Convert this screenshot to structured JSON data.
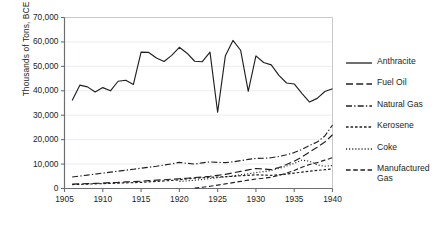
{
  "chart_data": {
    "type": "line",
    "title": "",
    "xlabel": "",
    "ylabel": "Thousands of Tons, BCE",
    "xlim": [
      1905,
      1940
    ],
    "ylim": [
      0,
      70000
    ],
    "grid": true,
    "legend_position": "right",
    "xticks": [
      "1905",
      "1910",
      "1915",
      "1920",
      "1925",
      "1930",
      "1935",
      "1940"
    ],
    "xtick_values": [
      1905,
      1910,
      1915,
      1920,
      1925,
      1930,
      1935,
      1940
    ],
    "yticks": [
      "0",
      "10,000",
      "20,000",
      "30,000",
      "40,000",
      "50,000",
      "60,000",
      "70,000"
    ],
    "ytick_values": [
      0,
      10000,
      20000,
      30000,
      40000,
      50000,
      60000,
      70000
    ],
    "x": [
      1906,
      1907,
      1908,
      1909,
      1910,
      1911,
      1912,
      1913,
      1914,
      1915,
      1916,
      1917,
      1918,
      1919,
      1920,
      1921,
      1922,
      1923,
      1924,
      1925,
      1926,
      1927,
      1928,
      1929,
      1930,
      1931,
      1932,
      1933,
      1934,
      1935,
      1936,
      1937,
      1938,
      1939,
      1940
    ],
    "series": [
      {
        "name": "Anthracite",
        "style": "solid",
        "color": "#231f20",
        "values": [
          36000,
          42300,
          41600,
          39500,
          41300,
          40000,
          43900,
          44300,
          42600,
          55800,
          55700,
          53400,
          52000,
          54500,
          57800,
          55400,
          52100,
          51900,
          55800,
          31200,
          54200,
          60600,
          56600,
          39800,
          54300,
          51600,
          50600,
          46300,
          43200,
          42800,
          38900,
          35400,
          36900,
          39700,
          40800
        ]
      },
      {
        "name": "Fuel Oil",
        "style": "dashed",
        "color": "#231f20",
        "values": [
          1800,
          1900,
          2000,
          2100,
          2200,
          2400,
          2500,
          2700,
          2800,
          3000,
          3200,
          3400,
          3600,
          3800,
          4000,
          4200,
          4500,
          4700,
          5000,
          5400,
          5800,
          6400,
          7000,
          7600,
          8200,
          8000,
          7700,
          8600,
          9800,
          11200,
          12900,
          14900,
          16900,
          19000,
          22000
        ]
      },
      {
        "name": "Natural Gas",
        "style": "dashdot",
        "color": "#231f20",
        "values": [
          4700,
          5100,
          5500,
          5900,
          6300,
          6700,
          7100,
          7500,
          7900,
          8300,
          8700,
          9100,
          9600,
          10100,
          10700,
          10300,
          10000,
          10500,
          10900,
          10700,
          10600,
          10900,
          11400,
          11900,
          12300,
          12400,
          12600,
          13100,
          13800,
          14700,
          16000,
          17600,
          19000,
          21500,
          26000
        ]
      },
      {
        "name": "Kerosene",
        "style": "shortdash",
        "color": "#231f20",
        "values": [
          1600,
          1700,
          1800,
          1900,
          2000,
          2100,
          2200,
          2300,
          2400,
          2500,
          2700,
          2900,
          3100,
          3300,
          3600,
          3900,
          4200,
          4400,
          4600,
          4700,
          4800,
          5000,
          5200,
          5400,
          5600,
          5500,
          5400,
          5600,
          5900,
          6300,
          6700,
          7100,
          7400,
          7700,
          8000
        ]
      },
      {
        "name": "Coke",
        "style": "dotted",
        "color": "#231f20",
        "values": [
          null,
          null,
          null,
          null,
          null,
          null,
          null,
          null,
          null,
          null,
          null,
          null,
          null,
          null,
          2900,
          3100,
          3400,
          3700,
          4100,
          4400,
          4800,
          5200,
          5600,
          6000,
          6500,
          6900,
          7400,
          8200,
          9200,
          10300,
          11600,
          11200,
          9600,
          9100,
          9400
        ]
      },
      {
        "name": "Manufactured Gas",
        "style": "dashdash",
        "color": "#231f20",
        "values": [
          null,
          null,
          null,
          null,
          null,
          null,
          null,
          null,
          null,
          null,
          null,
          null,
          null,
          null,
          null,
          null,
          200,
          500,
          900,
          1400,
          1900,
          2400,
          2900,
          3400,
          3900,
          4200,
          4600,
          5400,
          6300,
          7400,
          8700,
          9800,
          10600,
          11600,
          12600
        ]
      }
    ]
  },
  "legend": {
    "items": [
      {
        "label": "Anthracite"
      },
      {
        "label": "Fuel Oil"
      },
      {
        "label": "Natural Gas"
      },
      {
        "label": "Kerosene"
      },
      {
        "label": "Coke"
      },
      {
        "label": "Manufactured Gas"
      }
    ]
  }
}
